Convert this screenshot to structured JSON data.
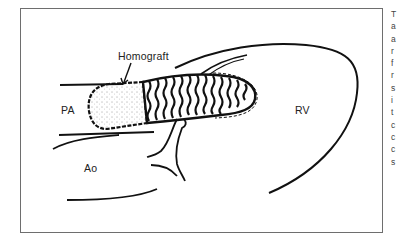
{
  "figure": {
    "labels": {
      "homograft": "Homograft",
      "pa": "PA",
      "ao": "Ao",
      "rv": "RV"
    },
    "stroke_color": "#111111",
    "frame_color": "#6e6e6e"
  },
  "caption": {
    "visible_letters": [
      "T",
      "a",
      "a",
      "r",
      "f",
      "r",
      "s",
      "i",
      "t",
      "c",
      "c",
      "c",
      "s"
    ]
  }
}
